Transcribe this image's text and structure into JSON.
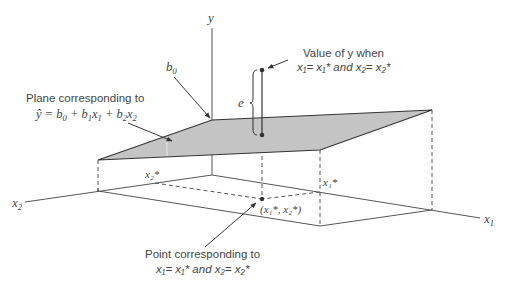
{
  "axes": {
    "y_label": "y",
    "x1_label": "x",
    "x1_sub": "1",
    "x2_label": "x",
    "x2_sub": "2"
  },
  "intercept": {
    "label": "b",
    "sub": "0"
  },
  "plane_annotation": {
    "line1": "Plane corresponding to",
    "eq_yhat": "ŷ",
    "eq_rest": " = b",
    "eq_b0sub": "0",
    "eq_plus1": " + b",
    "eq_b1sub": "1",
    "eq_x1": "x",
    "eq_x1sub": "1",
    "eq_plus2": " + b",
    "eq_b2sub": "2",
    "eq_x2": "x",
    "eq_x2sub": "2"
  },
  "observed_annotation": {
    "line1": "Value of y when",
    "line2": "x₁= x₁*  and x₂= x₂*"
  },
  "residual": {
    "label": "e"
  },
  "floor_labels": {
    "x1_star": "x₁*",
    "x2_star": "x₂*",
    "point": "(x₁*, x₂*)"
  },
  "point_annotation": {
    "line1": "Point corresponding to",
    "line2": "x₁= x₁*  and x₂= x₂*"
  },
  "colors": {
    "plane_fill": "#c4c4c4",
    "line": "#333333",
    "text": "#444444"
  }
}
